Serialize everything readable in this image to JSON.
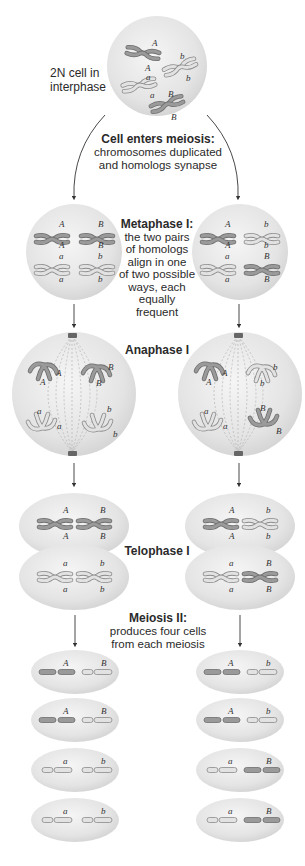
{
  "diagram": {
    "colors": {
      "cell_fill": "#e6e6e6",
      "cell_highlight": "#f4f4f4",
      "chromosome_dark": "#8c8c8c",
      "chromosome_light": "#d4d4d4",
      "outline": "#6e6e6e",
      "arrow": "#333333"
    },
    "labels": {
      "interphase": "2N cell in interphase",
      "interphase_line1": "2N cell in",
      "interphase_line2": "interphase",
      "enters_meiosis_title": "Cell enters meiosis:",
      "enters_meiosis_line1": "chromosomes duplicated",
      "enters_meiosis_line2": "and homologs synapse",
      "metaphase_title": "Metaphase I:",
      "metaphase_line1": "the two pairs",
      "metaphase_line2": "of homologs",
      "metaphase_line3": "align in one",
      "metaphase_line4": "of two possible",
      "metaphase_line5": "ways, each",
      "metaphase_line6": "equally frequent",
      "anaphase_title": "Anaphase I",
      "telophase_title": "Telophase I",
      "meiosis2_title": "Meiosis II:",
      "meiosis2_line1": "produces four cells",
      "meiosis2_line2": "from each meiosis"
    },
    "interphase_cell": {
      "chromosomes": [
        {
          "top": "A",
          "bottom": "A",
          "shade": "dark"
        },
        {
          "top": "b",
          "bottom": "b",
          "shade": "light"
        },
        {
          "top": "a",
          "bottom": "a",
          "shade": "light"
        },
        {
          "top": "B",
          "bottom": "B",
          "shade": "dark"
        }
      ]
    },
    "pathways": [
      {
        "side": "left",
        "metaphase": {
          "top_row": [
            "A",
            "B"
          ],
          "bottom_row": [
            "a",
            "b"
          ]
        },
        "anaphase": {
          "top_pole": [
            "A",
            "B"
          ],
          "bottom_pole": [
            "a",
            "b"
          ]
        },
        "telophase": {
          "top_cell": [
            "A",
            "B"
          ],
          "bottom_cell": [
            "a",
            "b"
          ]
        },
        "gametes": [
          [
            "A",
            "B"
          ],
          [
            "A",
            "B"
          ],
          [
            "a",
            "b"
          ],
          [
            "a",
            "b"
          ]
        ]
      },
      {
        "side": "right",
        "metaphase": {
          "top_row": [
            "A",
            "b"
          ],
          "bottom_row": [
            "a",
            "B"
          ]
        },
        "anaphase": {
          "top_pole": [
            "A",
            "b"
          ],
          "bottom_pole": [
            "a",
            "B"
          ]
        },
        "telophase": {
          "top_cell": [
            "A",
            "b"
          ],
          "bottom_cell": [
            "a",
            "B"
          ]
        },
        "gametes": [
          [
            "A",
            "b"
          ],
          [
            "A",
            "b"
          ],
          [
            "a",
            "B"
          ],
          [
            "a",
            "B"
          ]
        ]
      }
    ]
  }
}
